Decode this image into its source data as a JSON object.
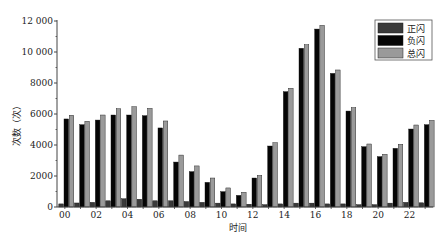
{
  "chart_data": {
    "type": "bar",
    "title": "",
    "xlabel": "时间",
    "ylabel": "次数（次）",
    "ylim": [
      0,
      12000
    ],
    "yticks": [
      0,
      2000,
      4000,
      6000,
      8000,
      10000,
      12000
    ],
    "ytick_labels": [
      "0",
      "2000",
      "4000",
      "6000",
      "8000",
      "10 000",
      "12 000"
    ],
    "categories": [
      "00",
      "01",
      "02",
      "03",
      "04",
      "05",
      "06",
      "07",
      "08",
      "09",
      "10",
      "11",
      "12",
      "13",
      "14",
      "15",
      "16",
      "17",
      "18",
      "19",
      "20",
      "21",
      "22",
      "23"
    ],
    "xtick_labels_shown": [
      "00",
      "02",
      "04",
      "06",
      "08",
      "10",
      "12",
      "14",
      "16",
      "18",
      "20",
      "22"
    ],
    "legend_position": "upper right",
    "grid": false,
    "series": [
      {
        "name": "正闪",
        "color": "#3a3a3a",
        "values": [
          200,
          260,
          300,
          400,
          530,
          500,
          400,
          400,
          350,
          300,
          250,
          200,
          180,
          150,
          200,
          250,
          250,
          200,
          200,
          150,
          150,
          250,
          300,
          270
        ]
      },
      {
        "name": "负闪",
        "color": "#050505",
        "values": [
          5680,
          5310,
          5610,
          5935,
          5935,
          5890,
          5100,
          2900,
          2280,
          1590,
          990,
          750,
          1870,
          3935,
          7440,
          10240,
          11480,
          8620,
          6190,
          3890,
          3250,
          3785,
          5030,
          5310
        ]
      },
      {
        "name": "总闪",
        "color": "#9a9a9a",
        "values": [
          5920,
          5530,
          5935,
          6340,
          6470,
          6365,
          5550,
          3350,
          2650,
          1870,
          1230,
          950,
          2040,
          4150,
          7660,
          10470,
          11720,
          8840,
          6410,
          4065,
          3400,
          4045,
          5290,
          5590
        ]
      }
    ]
  },
  "legend": {
    "items": [
      {
        "label": "正闪",
        "color": "#3a3a3a"
      },
      {
        "label": "负闪",
        "color": "#050505"
      },
      {
        "label": "总闪",
        "color": "#9a9a9a"
      }
    ]
  },
  "axes": {
    "x_title": "时间",
    "y_title": "次数（次）"
  }
}
